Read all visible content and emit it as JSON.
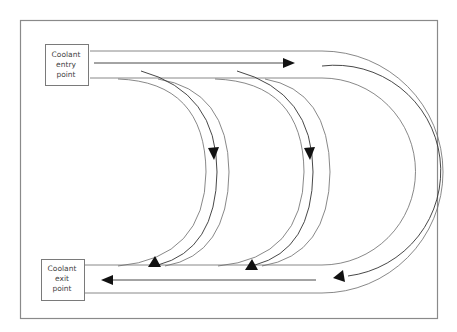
{
  "diagram": {
    "entry_label": {
      "line1": "Coolant",
      "line2": "entry",
      "line3": "point"
    },
    "exit_label": {
      "line1": "Coolant",
      "line2": "exit",
      "line3": "point"
    },
    "flow_direction": "entry at top-left, flows right then splits into three curved channels descending to exit at bottom-left",
    "channels": [
      {
        "name": "inner-channel",
        "arrow_down": "down-right",
        "arrow_up": "up"
      },
      {
        "name": "middle-channel",
        "arrow_down": "down-right",
        "arrow_up": "up"
      },
      {
        "name": "outer-channel",
        "arrow_top": "right",
        "arrow_bottom": "left"
      }
    ],
    "colors": {
      "line": "#6a6a6a",
      "arrow": "#111111",
      "frame": "#8a8a8a",
      "background": "#ffffff"
    }
  }
}
